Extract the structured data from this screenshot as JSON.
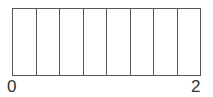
{
  "diagram": {
    "type": "fraction-bar",
    "segments": 8,
    "start_label": "0",
    "end_label": "2",
    "line_color": "#555555",
    "fill_color": "#ffffff"
  }
}
